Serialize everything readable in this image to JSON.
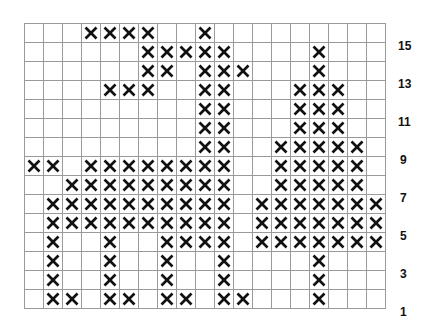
{
  "pattern": {
    "columns": 19,
    "rows": 15,
    "mark_symbol": "X",
    "row_labels": [
      "15",
      "13",
      "11",
      "9",
      "7",
      "5",
      "3",
      "1"
    ],
    "filled": {
      "15": [
        3,
        4,
        5,
        6,
        9
      ],
      "14": [
        6,
        7,
        8,
        9,
        10,
        15
      ],
      "13": [
        6,
        7,
        9,
        10,
        11,
        15
      ],
      "12": [
        4,
        5,
        6,
        9,
        10,
        14,
        15,
        16
      ],
      "11": [
        9,
        10,
        14,
        15,
        16
      ],
      "10": [
        9,
        10,
        14,
        15,
        16
      ],
      "9": [
        9,
        10,
        13,
        14,
        15,
        16,
        17
      ],
      "8": [
        0,
        1,
        3,
        4,
        5,
        6,
        7,
        8,
        9,
        10,
        13,
        14,
        15,
        16,
        17
      ],
      "7": [
        2,
        3,
        4,
        5,
        6,
        7,
        8,
        9,
        10,
        13,
        14,
        15,
        16,
        17
      ],
      "6": [
        1,
        2,
        3,
        4,
        5,
        6,
        7,
        8,
        9,
        10,
        12,
        13,
        14,
        15,
        16,
        17,
        18
      ],
      "5": [
        1,
        2,
        3,
        4,
        5,
        6,
        7,
        8,
        9,
        10,
        12,
        13,
        14,
        15,
        16,
        17,
        18
      ],
      "4": [
        1,
        4,
        7,
        8,
        9,
        10,
        12,
        13,
        14,
        15,
        16,
        17,
        18
      ],
      "3": [
        1,
        4,
        7,
        10,
        15
      ],
      "2": [
        1,
        4,
        7,
        10,
        15
      ],
      "1": [
        1,
        2,
        4,
        5,
        7,
        8,
        10,
        11,
        15
      ]
    }
  },
  "colors": {
    "grid_line": "#9a9a9a",
    "mark": "#111111",
    "background": "#ffffff"
  }
}
